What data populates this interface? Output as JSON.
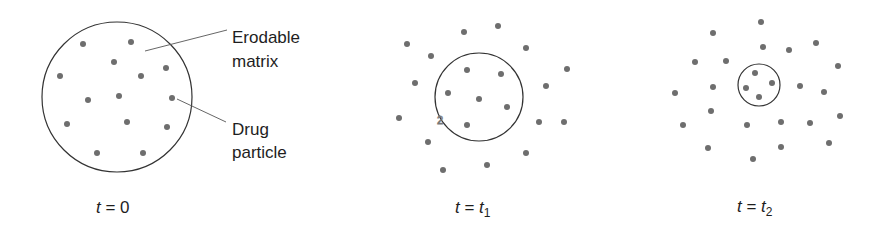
{
  "figure": {
    "colors": {
      "dot": "#6e6e6e",
      "outline": "#333333",
      "leader": "#555555",
      "text": "#1e1e1e"
    },
    "labels": {
      "matrix_line1": "Erodable",
      "matrix_line2": "matrix",
      "drug_line1": "Drug",
      "drug_line2": "particle"
    },
    "panels": [
      {
        "caption_var": "t",
        "caption_eq": " = ",
        "caption_val": "0",
        "caption_sub": "",
        "circle": {
          "cx": 117,
          "cy": 97,
          "r": 75
        },
        "dots": [
          [
            83,
            44
          ],
          [
            131,
            42
          ],
          [
            114,
            62
          ],
          [
            60,
            76
          ],
          [
            141,
            76
          ],
          [
            166,
            68
          ],
          [
            88,
            100
          ],
          [
            119,
            96
          ],
          [
            172,
            98
          ],
          [
            67,
            124
          ],
          [
            127,
            122
          ],
          [
            167,
            127
          ],
          [
            97,
            153
          ],
          [
            143,
            153
          ]
        ]
      },
      {
        "caption_var": "t",
        "caption_eq": " = ",
        "caption_val": "t",
        "caption_sub": "1",
        "circle": {
          "cx": 479,
          "cy": 97,
          "r": 44
        },
        "dots": [
          [
            407,
            44
          ],
          [
            464,
            32
          ],
          [
            498,
            26
          ],
          [
            526,
            48
          ],
          [
            431,
            56
          ],
          [
            567,
            69
          ],
          [
            467,
            70
          ],
          [
            501,
            74
          ],
          [
            415,
            83
          ],
          [
            546,
            86
          ],
          [
            448,
            93
          ],
          [
            479,
            99
          ],
          [
            507,
            107
          ],
          [
            399,
            118
          ],
          [
            539,
            122
          ],
          [
            564,
            122
          ],
          [
            467,
            125
          ],
          [
            428,
            142
          ],
          [
            526,
            153
          ],
          [
            487,
            165
          ],
          [
            443,
            170
          ]
        ],
        "artifact": "2"
      },
      {
        "caption_var": "t",
        "caption_eq": " = ",
        "caption_val": "t",
        "caption_sub": "2",
        "circle": {
          "cx": 759,
          "cy": 85,
          "r": 21
        },
        "dots": [
          [
            761,
            22
          ],
          [
            713,
            33
          ],
          [
            763,
            47
          ],
          [
            816,
            43
          ],
          [
            789,
            50
          ],
          [
            695,
            62
          ],
          [
            726,
            61
          ],
          [
            838,
            66
          ],
          [
            755,
            73
          ],
          [
            772,
            83
          ],
          [
            746,
            88
          ],
          [
            713,
            87
          ],
          [
            800,
            86
          ],
          [
            675,
            93
          ],
          [
            824,
            92
          ],
          [
            759,
            97
          ],
          [
            711,
            111
          ],
          [
            840,
            116
          ],
          [
            683,
            125
          ],
          [
            747,
            125
          ],
          [
            781,
            122
          ],
          [
            810,
            123
          ],
          [
            708,
            148
          ],
          [
            781,
            147
          ],
          [
            829,
            143
          ],
          [
            753,
            159
          ]
        ]
      }
    ]
  }
}
